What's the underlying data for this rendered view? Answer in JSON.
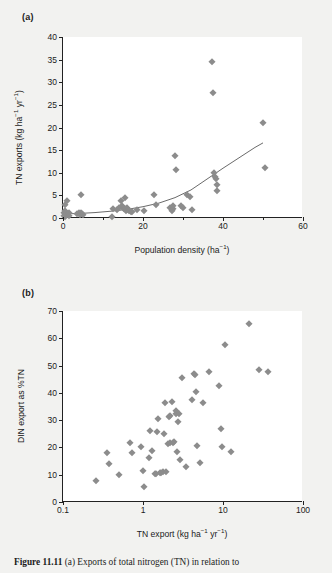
{
  "figure": {
    "background_color": "#f2f2f0",
    "marker_color": "#8c8c8c",
    "axis_color": "#222222",
    "caption_prefix": "Figure 11.11",
    "caption_text": "  (a) Exports of total nitrogen (TN) in relation to"
  },
  "panel_a": {
    "label": "(a)",
    "chart_data": {
      "type": "scatter",
      "title": "",
      "xlabel": "Population density (ha⁻¹)",
      "ylabel": "TN exports (kg ha⁻¹ yr⁻¹)",
      "xlim": [
        0,
        60
      ],
      "ylim": [
        0,
        40
      ],
      "xscale": "linear",
      "yscale": "linear",
      "xticks": [
        0,
        20,
        40,
        60
      ],
      "xticks_minor": [
        10,
        30,
        50
      ],
      "yticks": [
        0,
        5,
        10,
        15,
        20,
        25,
        30,
        35,
        40
      ],
      "grid": false,
      "legend": "none",
      "points": [
        [
          0.2,
          0.5
        ],
        [
          0.3,
          1.0
        ],
        [
          0.4,
          2.9
        ],
        [
          0.5,
          0.3
        ],
        [
          0.6,
          1.5
        ],
        [
          0.8,
          0.6
        ],
        [
          1.0,
          3.7
        ],
        [
          1.2,
          0.9
        ],
        [
          1.4,
          0.4
        ],
        [
          1.6,
          1.1
        ],
        [
          3.6,
          0.8
        ],
        [
          3.9,
          1.0
        ],
        [
          4.2,
          0.7
        ],
        [
          4.4,
          5.0
        ],
        [
          4.6,
          1.2
        ],
        [
          4.8,
          0.9
        ],
        [
          5.0,
          0.6
        ],
        [
          12.2,
          0.3
        ],
        [
          12.6,
          2.0
        ],
        [
          13.4,
          1.7
        ],
        [
          14.0,
          2.2
        ],
        [
          14.4,
          3.8
        ],
        [
          14.8,
          2.6
        ],
        [
          15.0,
          2.3
        ],
        [
          15.2,
          1.9
        ],
        [
          15.4,
          4.5
        ],
        [
          15.6,
          2.0
        ],
        [
          15.8,
          1.6
        ],
        [
          16.0,
          2.1
        ],
        [
          16.3,
          1.8
        ],
        [
          16.6,
          1.5
        ],
        [
          16.9,
          1.4
        ],
        [
          17.2,
          1.3
        ],
        [
          18.6,
          1.8
        ],
        [
          20.2,
          1.6
        ],
        [
          22.8,
          5.0
        ],
        [
          23.2,
          2.9
        ],
        [
          26.8,
          2.1
        ],
        [
          27.2,
          1.5
        ],
        [
          27.4,
          2.6
        ],
        [
          27.6,
          1.9
        ],
        [
          28.0,
          13.7
        ],
        [
          28.2,
          10.7
        ],
        [
          29.6,
          2.6
        ],
        [
          30.0,
          2.3
        ],
        [
          31.0,
          5.0
        ],
        [
          31.8,
          4.7
        ],
        [
          32.2,
          1.8
        ],
        [
          37.2,
          34.4
        ],
        [
          37.6,
          27.6
        ],
        [
          37.8,
          9.9
        ],
        [
          38.0,
          9.1
        ],
        [
          38.2,
          8.6
        ],
        [
          38.4,
          7.4
        ],
        [
          38.6,
          5.9
        ],
        [
          50.0,
          21.1
        ],
        [
          50.4,
          11.1
        ]
      ],
      "fit_curve": {
        "description": "exponential regression line",
        "points": [
          [
            0,
            0.9
          ],
          [
            4,
            1.0
          ],
          [
            8,
            1.2
          ],
          [
            12,
            1.5
          ],
          [
            16,
            1.9
          ],
          [
            20,
            2.5
          ],
          [
            24,
            3.3
          ],
          [
            28,
            4.5
          ],
          [
            32,
            6.2
          ],
          [
            36,
            8.6
          ],
          [
            40,
            11.0
          ],
          [
            44,
            13.3
          ],
          [
            48,
            15.6
          ],
          [
            50,
            16.6
          ]
        ]
      }
    }
  },
  "panel_b": {
    "label": "(b)",
    "chart_data": {
      "type": "scatter",
      "title": "",
      "xlabel": "TN export (kg ha⁻¹ yr⁻¹)",
      "ylabel": "DIN export as %TN",
      "xlim": [
        0.1,
        100
      ],
      "ylim": [
        0,
        70
      ],
      "xscale": "log",
      "yscale": "linear",
      "xticks": [
        0.1,
        1,
        10,
        100
      ],
      "xtick_labels": [
        "0.1",
        "1",
        "10",
        "100"
      ],
      "yticks": [
        0,
        10,
        20,
        30,
        40,
        50,
        60,
        70
      ],
      "grid": false,
      "legend": "none",
      "points": [
        [
          0.26,
          7.7
        ],
        [
          0.35,
          18.0
        ],
        [
          0.38,
          13.9
        ],
        [
          0.5,
          10.0
        ],
        [
          0.68,
          21.6
        ],
        [
          0.72,
          17.9
        ],
        [
          0.95,
          20.3
        ],
        [
          1.0,
          11.2
        ],
        [
          1.02,
          5.4
        ],
        [
          1.2,
          16.2
        ],
        [
          1.22,
          26.0
        ],
        [
          1.3,
          18.7
        ],
        [
          1.4,
          10.2
        ],
        [
          1.45,
          10.1
        ],
        [
          1.48,
          25.6
        ],
        [
          1.55,
          30.3
        ],
        [
          1.62,
          10.6
        ],
        [
          1.7,
          10.8
        ],
        [
          1.78,
          10.9
        ],
        [
          1.85,
          24.9
        ],
        [
          1.9,
          36.4
        ],
        [
          1.95,
          11.0
        ],
        [
          2.05,
          21.1
        ],
        [
          2.1,
          31.2
        ],
        [
          2.15,
          21.5
        ],
        [
          2.2,
          31.6
        ],
        [
          2.3,
          36.7
        ],
        [
          2.4,
          21.8
        ],
        [
          2.45,
          22.0
        ],
        [
          2.55,
          33.4
        ],
        [
          2.6,
          32.4
        ],
        [
          2.65,
          18.4
        ],
        [
          2.7,
          29.5
        ],
        [
          2.8,
          32.2
        ],
        [
          2.9,
          15.4
        ],
        [
          3.1,
          45.5
        ],
        [
          3.4,
          12.9
        ],
        [
          4.1,
          37.4
        ],
        [
          4.3,
          46.9
        ],
        [
          4.45,
          46.4
        ],
        [
          4.6,
          40.2
        ],
        [
          4.8,
          20.7
        ],
        [
          5.1,
          14.4
        ],
        [
          5.6,
          36.2
        ],
        [
          6.6,
          47.8
        ],
        [
          8.9,
          42.5
        ],
        [
          9.4,
          26.8
        ],
        [
          9.8,
          20.2
        ],
        [
          10.5,
          57.6
        ],
        [
          12.5,
          18.5
        ],
        [
          21.0,
          65.4
        ],
        [
          28.0,
          48.2
        ],
        [
          36.0,
          47.7
        ]
      ]
    }
  }
}
